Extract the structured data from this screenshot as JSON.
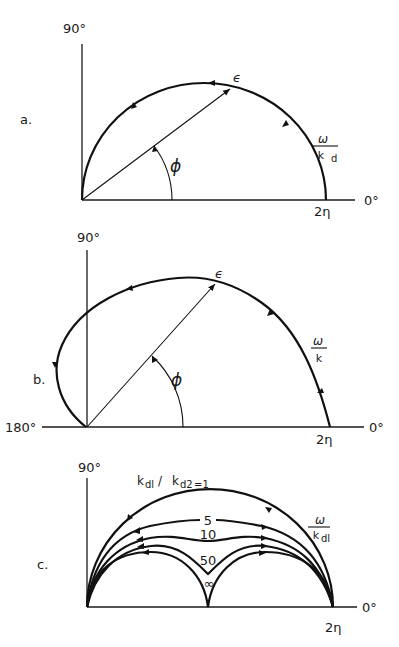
{
  "figure": {
    "panels": [
      {
        "id": "a",
        "label": "a.",
        "axis_top_label": "90°",
        "axis_right_label": "0°",
        "axis_left_label": "",
        "intercept_label": "2η",
        "vector_label": "ϵ",
        "angle_label": "ϕ",
        "curve_label_num": "ω",
        "curve_label_den": "k",
        "curve_label_den_sub": "d",
        "description": "Semicircular locus of complex vector ϵ from 0 to 2η; arrows indicate increasing ω/k_d (counterclockwise)."
      },
      {
        "id": "b",
        "label": "b.",
        "axis_top_label": "90°",
        "axis_right_label": "0°",
        "axis_left_label": "180°",
        "intercept_label": "2η",
        "vector_label": "ϵ",
        "angle_label": "ϕ",
        "curve_label_num": "ω",
        "curve_label_den": "k",
        "curve_label_den_sub": "",
        "description": "Locus starting at 2η, sweeping past 90° into second quadrant and returning to origin from 180° side."
      },
      {
        "id": "c",
        "label": "c.",
        "axis_top_label": "90°",
        "axis_right_label": "0°",
        "axis_left_label": "",
        "intercept_label": "2η",
        "curve_label_num": "ω",
        "curve_label_den": "k",
        "curve_label_den_sub": "dl",
        "family_label_k1": "k",
        "family_label_k1_sub": "dl",
        "family_label_sep": " / ",
        "family_label_k2": "k",
        "family_label_k2_sub": "d2",
        "family_label_eq": "=1",
        "curves": [
          {
            "ratio": "1"
          },
          {
            "ratio": "5"
          },
          {
            "ratio": "10"
          },
          {
            "ratio": "50"
          },
          {
            "ratio": "∞"
          }
        ],
        "description": "Family of loci for k_d1/k_d2 = 1, 5, 10, 50, ∞; the ∞ case splits into two semicircles meeting at η."
      }
    ]
  }
}
